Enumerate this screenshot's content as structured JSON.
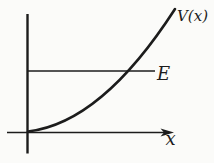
{
  "figure": {
    "background": "#fbfbf9",
    "ink_color": "#1c1c1c",
    "labels": {
      "potential_curve": "V(x)",
      "energy_level": "E",
      "x_axis": "x"
    }
  }
}
